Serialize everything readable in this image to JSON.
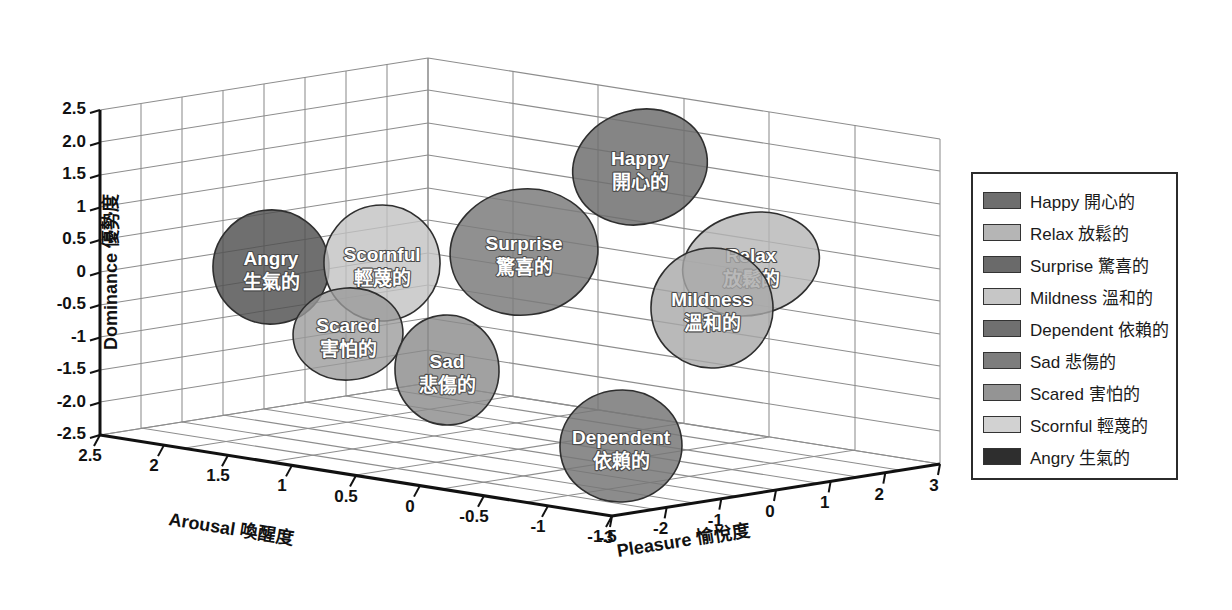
{
  "chart_data": {
    "type": "scatter",
    "title": "",
    "subtitle": "",
    "projection": "3d",
    "grid": true,
    "legend_position": "right",
    "axes": {
      "x": {
        "label": "Pleasure 愉悅度",
        "name_en": "Pleasure",
        "name_zh": "愉悅度",
        "ticks": [
          "-3",
          "-2",
          "-1",
          "0",
          "1",
          "2",
          "3"
        ],
        "range": [
          -3,
          3
        ]
      },
      "y": {
        "label": "Arousal 喚醒度",
        "name_en": "Arousal",
        "name_zh": "喚醒度",
        "ticks": [
          "2.5",
          "2",
          "1.5",
          "1",
          "0.5",
          "0",
          "-0.5",
          "-1",
          "-1.5"
        ],
        "range": [
          -1.5,
          2.5
        ]
      },
      "z": {
        "label": "Dominance 優勢度",
        "name_en": "Dominance",
        "name_zh": "優勢度",
        "ticks": [
          "2.5",
          "2.0",
          "1.5",
          "1",
          "0.5",
          "0",
          "-0.5",
          "-1",
          "-1.5",
          "-2.0",
          "-2.5"
        ],
        "range": [
          -2.5,
          2.5
        ]
      }
    },
    "categories": [
      "Happy",
      "Relax",
      "Surprise",
      "Mildness",
      "Dependent",
      "Sad",
      "Scared",
      "Scornful",
      "Angry"
    ],
    "points": [
      {
        "name_en": "Happy",
        "name_zh": "開心的",
        "pleasure": 1.7,
        "arousal": 0.9,
        "dominance": 1.6,
        "color": "#6e6e6e"
      },
      {
        "name_en": "Relax",
        "name_zh": "放鬆的",
        "pleasure": 2.4,
        "arousal": -0.6,
        "dominance": 0.5,
        "color": "#b5b5b5"
      },
      {
        "name_en": "Surprise",
        "name_zh": "驚喜的",
        "pleasure": 0.4,
        "arousal": 1.3,
        "dominance": 0.7,
        "color": "#7b7b7b"
      },
      {
        "name_en": "Mildness",
        "name_zh": "溫和的",
        "pleasure": 2.0,
        "arousal": -0.2,
        "dominance": -0.2,
        "color": "#a8a8a8"
      },
      {
        "name_en": "Dependent",
        "name_zh": "依賴的",
        "pleasure": 0.3,
        "arousal": -1.1,
        "dominance": -2.0,
        "color": "#767676"
      },
      {
        "name_en": "Sad",
        "name_zh": "悲傷的",
        "pleasure": -1.0,
        "arousal": 0.1,
        "dominance": -1.5,
        "color": "#8a8a8a"
      },
      {
        "name_en": "Scared",
        "name_zh": "害怕的",
        "pleasure": -1.6,
        "arousal": 0.7,
        "dominance": -0.9,
        "color": "#9a9a9a"
      },
      {
        "name_en": "Scornful",
        "name_zh": "輕蔑的",
        "pleasure": -1.8,
        "arousal": 1.2,
        "dominance": 0.4,
        "color": "#c2c2c2"
      },
      {
        "name_en": "Angry",
        "name_zh": "生氣的",
        "pleasure": -2.3,
        "arousal": 1.5,
        "dominance": 0.2,
        "color": "#4f4f4f"
      }
    ]
  },
  "axis_titles": {
    "z": "Dominance 優勢度",
    "y": "Arousal 喚醒度",
    "x": "Pleasure 愉悅度"
  },
  "z_ticks": [
    "2.5",
    "2.0",
    "1.5",
    "1",
    "0.5",
    "0",
    "-0.5",
    "-1",
    "-1.5",
    "-2.0",
    "-2.5"
  ],
  "y_ticks": [
    "2.5",
    "2",
    "1.5",
    "1",
    "0.5",
    "0",
    "-0.5",
    "-1",
    "-1.5"
  ],
  "x_ticks": [
    "-3",
    "-2",
    "-1",
    "0",
    "1",
    "2",
    "3"
  ],
  "bubbles": [
    {
      "en": "Angry",
      "zh": "生氣的",
      "cx": 271,
      "cy": 267,
      "rx": 58,
      "ry": 57,
      "fill": "#4f4f4f",
      "opacity": 0.82,
      "rot": -8
    },
    {
      "en": "Scornful",
      "zh": "輕蔑的",
      "cx": 382,
      "cy": 263,
      "rx": 58,
      "ry": 58,
      "fill": "#c2c2c2",
      "opacity": 0.8,
      "rot": -6
    },
    {
      "en": "Scared",
      "zh": "害怕的",
      "cx": 348,
      "cy": 334,
      "rx": 55,
      "ry": 46,
      "fill": "#9a9a9a",
      "opacity": 0.78,
      "rot": -5
    },
    {
      "en": "Sad",
      "zh": "悲傷的",
      "cx": 447,
      "cy": 370,
      "rx": 52,
      "ry": 55,
      "fill": "#8a8a8a",
      "opacity": 0.8,
      "rot": -4
    },
    {
      "en": "Surprise",
      "zh": "驚喜的",
      "cx": 524,
      "cy": 252,
      "rx": 74,
      "ry": 63,
      "fill": "#7b7b7b",
      "opacity": 0.84,
      "rot": -7
    },
    {
      "en": "Happy",
      "zh": "開心的",
      "cx": 640,
      "cy": 167,
      "rx": 68,
      "ry": 57,
      "fill": "#6e6e6e",
      "opacity": 0.84,
      "rot": -16
    },
    {
      "en": "Dependent",
      "zh": "依賴的",
      "cx": 621,
      "cy": 446,
      "rx": 61,
      "ry": 56,
      "fill": "#767676",
      "opacity": 0.84,
      "rot": -5
    },
    {
      "en": "Relax",
      "zh": "放鬆的",
      "cx": 751,
      "cy": 264,
      "rx": 69,
      "ry": 51,
      "fill": "#b5b5b5",
      "opacity": 0.8,
      "rot": -12
    },
    {
      "en": "Mildness",
      "zh": "溫和的",
      "cx": 712,
      "cy": 308,
      "rx": 61,
      "ry": 60,
      "fill": "#a8a8a8",
      "opacity": 0.8,
      "rot": -6
    }
  ],
  "legend": {
    "items": [
      {
        "label": "Happy 開心的",
        "color": "#6e6e6e"
      },
      {
        "label": "Relax 放鬆的",
        "color": "#b5b5b5"
      },
      {
        "label": "Surprise 驚喜的",
        "color": "#6a6a6a"
      },
      {
        "label": "Mildness 溫和的",
        "color": "#c6c6c6"
      },
      {
        "label": "Dependent 依賴的",
        "color": "#707070"
      },
      {
        "label": "Sad 悲傷的",
        "color": "#7d7d7d"
      },
      {
        "label": "Scared 害怕的",
        "color": "#949494"
      },
      {
        "label": "Scornful 輕蔑的",
        "color": "#d2d2d2"
      },
      {
        "label": "Angry 生氣的",
        "color": "#2e2e2e"
      }
    ]
  }
}
